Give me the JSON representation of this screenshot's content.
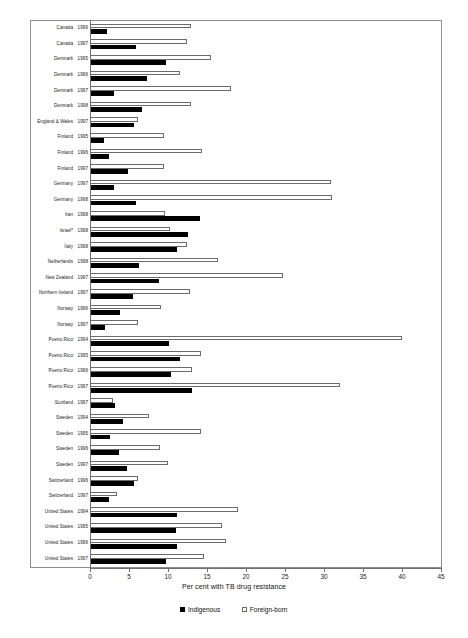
{
  "chart_data": {
    "type": "bar",
    "orientation": "horizontal",
    "title": "",
    "xlabel": "Per cent with TB drug resistance",
    "ylabel": "",
    "xlim": [
      0,
      45
    ],
    "xticks": [
      0,
      5,
      10,
      15,
      20,
      25,
      30,
      35,
      40,
      45
    ],
    "grid": false,
    "legend_position": "bottom",
    "series": [
      {
        "name": "Indigenous",
        "color": "#000000",
        "style": "filled",
        "values": [
          2.2,
          5.9,
          9.8,
          7.3,
          3.1,
          6.7,
          5.6,
          1.8,
          2.4,
          4.9,
          3.1,
          5.9,
          14.1,
          12.6,
          11.2,
          6.3,
          8.9,
          5.5,
          3.9,
          1.9,
          10.1,
          11.6,
          10.4,
          13.1,
          3.2,
          4.2,
          2.5,
          3.7,
          4.8,
          5.7,
          2.4,
          11.1,
          11.0,
          11.1,
          9.7
        ]
      },
      {
        "name": "Foreign-born",
        "color": "#ffffff",
        "style": "hollow",
        "values": [
          13.0,
          12.4,
          15.5,
          11.5,
          18.1,
          13.0,
          6.2,
          9.5,
          14.4,
          9.5,
          30.9,
          31.0,
          9.6,
          10.2,
          12.4,
          16.4,
          24.8,
          12.8,
          9.1,
          6.1,
          40.0,
          14.2,
          13.1,
          32.0,
          3.0,
          7.6,
          14.2,
          9.0,
          10.0,
          6.1,
          3.4,
          19.0,
          16.9,
          17.4,
          14.6
        ]
      }
    ],
    "categories": [
      {
        "country": "Canada",
        "year": "1996"
      },
      {
        "country": "Canada",
        "year": "1997"
      },
      {
        "country": "Denmark",
        "year": "1995"
      },
      {
        "country": "Denmark",
        "year": "1996"
      },
      {
        "country": "Denmark",
        "year": "1997"
      },
      {
        "country": "Denmark",
        "year": "1998"
      },
      {
        "country": "England & Wales",
        "year": "1997"
      },
      {
        "country": "Finland",
        "year": "1995"
      },
      {
        "country": "Finland",
        "year": "1996"
      },
      {
        "country": "Finland",
        "year": "1997"
      },
      {
        "country": "Germany",
        "year": "1997"
      },
      {
        "country": "Germany",
        "year": "1998"
      },
      {
        "country": "Iran",
        "year": "1998"
      },
      {
        "country": "Israel*",
        "year": "1998"
      },
      {
        "country": "Italy",
        "year": "1998"
      },
      {
        "country": "Netherlands",
        "year": "1998"
      },
      {
        "country": "New Zealand",
        "year": "1997"
      },
      {
        "country": "Northern Ireland",
        "year": "1997"
      },
      {
        "country": "Norway",
        "year": "1996"
      },
      {
        "country": "Norway",
        "year": "1997"
      },
      {
        "country": "Puerto Rico",
        "year": "1994"
      },
      {
        "country": "Puerto Rico",
        "year": "1995"
      },
      {
        "country": "Puerto Rico",
        "year": "1996"
      },
      {
        "country": "Puerto Rico",
        "year": "1997"
      },
      {
        "country": "Scotland",
        "year": "1997"
      },
      {
        "country": "Sweden",
        "year": "1994"
      },
      {
        "country": "Sweden",
        "year": "1995"
      },
      {
        "country": "Sweden",
        "year": "1996"
      },
      {
        "country": "Sweden",
        "year": "1997"
      },
      {
        "country": "Switzerland",
        "year": "1996"
      },
      {
        "country": "Switzerland",
        "year": "1997"
      },
      {
        "country": "United States",
        "year": "1994"
      },
      {
        "country": "United States",
        "year": "1995"
      },
      {
        "country": "United States",
        "year": "1996"
      },
      {
        "country": "United States",
        "year": "1997"
      }
    ]
  },
  "axis": {
    "x_title": "Per cent with TB drug resistance",
    "tick_labels": [
      "0",
      "5",
      "10",
      "15",
      "20",
      "25",
      "30",
      "35",
      "40",
      "45"
    ]
  },
  "legend": {
    "items": [
      {
        "label": "Indigenous",
        "swatch": "filled-black-square",
        "color": "#000000"
      },
      {
        "label": "Foreign-born",
        "swatch": "hollow-square",
        "color": "#ffffff"
      }
    ]
  }
}
